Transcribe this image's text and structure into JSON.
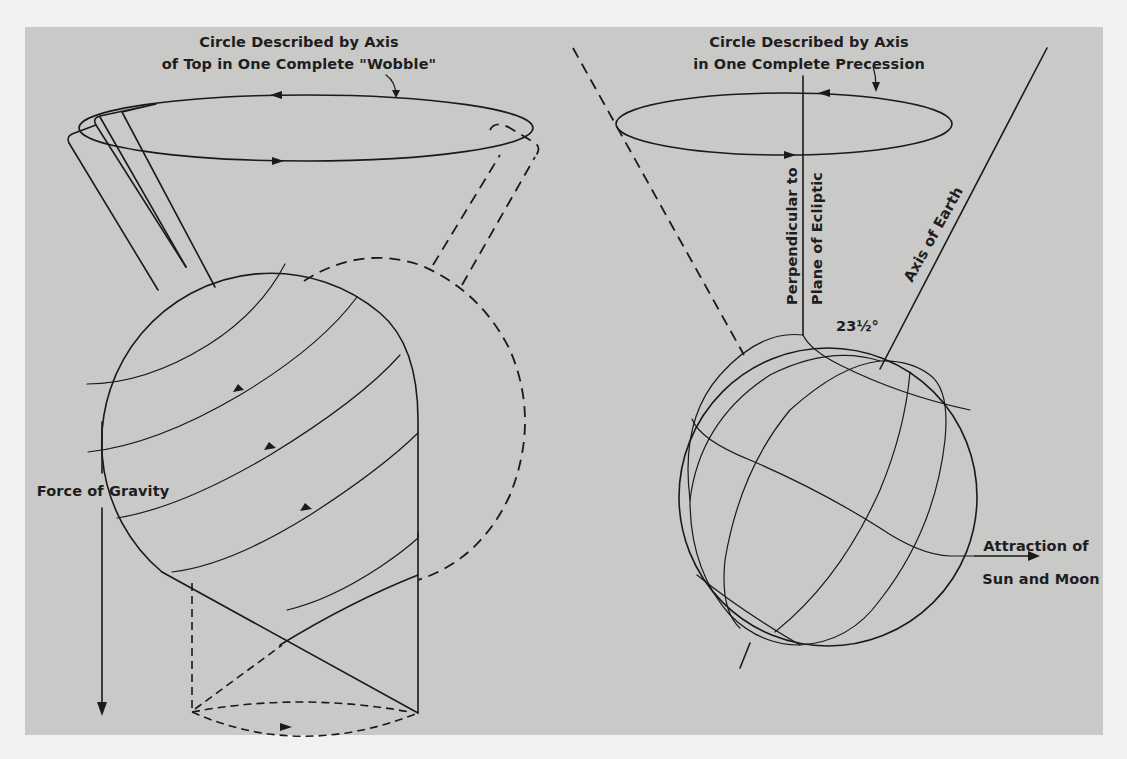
{
  "figure": {
    "colors": {
      "page_background": "#f1f1f0",
      "panel_background": "#c9c9c8",
      "ink": "#1a1a1a"
    },
    "left_panel": {
      "subject": "spinning-top",
      "circle_label_line1": "Circle Described by Axis",
      "circle_label_line2": "of Top in One Complete \"Wobble\"",
      "force_label": "Force of Gravity"
    },
    "right_panel": {
      "subject": "earth-globe",
      "circle_label_line1": "Circle Described by Axis",
      "circle_label_line2": "in One Complete Precession",
      "perpendicular_label_line1": "Perpendicular to",
      "perpendicular_label_line2": "Plane of Ecliptic",
      "axis_label": "Axis of Earth",
      "angle_label": "23½°",
      "attraction_label_line1": "Attraction of",
      "attraction_label_line2": "Sun and Moon"
    }
  }
}
